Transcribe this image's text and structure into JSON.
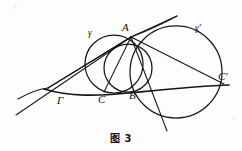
{
  "figure": {
    "caption": "图 3",
    "background_color": "#fdfdfd",
    "stroke_color": "#171717",
    "width": 242,
    "height": 151
  },
  "labels": {
    "point_A": "A",
    "point_B": "B",
    "point_C": "C",
    "point_C_prime": "C'",
    "circle_gamma": "γ",
    "circle_gamma_prime": "γ'",
    "curve_capital_gamma": "Γ"
  },
  "label_positions": {
    "point_A": {
      "x": 122,
      "y": 22
    },
    "point_B": {
      "x": 129,
      "y": 90
    },
    "point_C": {
      "x": 98,
      "y": 94
    },
    "point_C_prime": {
      "x": 218,
      "y": 71
    },
    "circle_gamma": {
      "x": 88,
      "y": 29
    },
    "circle_gamma_prime": {
      "x": 195,
      "y": 24
    },
    "curve_capital_gamma": {
      "x": 57,
      "y": 95
    }
  },
  "geometry": {
    "circle_gamma": {
      "cx": 114,
      "cy": 64,
      "r": 29,
      "name": "small-left-circle"
    },
    "circle_inner": {
      "cx": 128,
      "cy": 68,
      "r": 24,
      "name": "small-inner-circle"
    },
    "circle_gamma_prime": {
      "cx": 176,
      "cy": 72,
      "r": 46,
      "name": "large-right-circle"
    },
    "point_A": {
      "x": 131,
      "y": 37
    },
    "point_B": {
      "x": 128,
      "y": 92
    },
    "point_C": {
      "x": 104,
      "y": 92
    },
    "point_C_prime": {
      "x": 222,
      "y": 83
    },
    "apex_left": {
      "x": 48,
      "y": 88
    },
    "tangent_line_start": {
      "x": 16,
      "y": 115
    },
    "top_chord_end": {
      "x": 177,
      "y": 17
    },
    "lower_ray_end": {
      "x": 167,
      "y": 131
    },
    "gamma_curve_left_end": {
      "x": 44,
      "y": 89
    }
  }
}
